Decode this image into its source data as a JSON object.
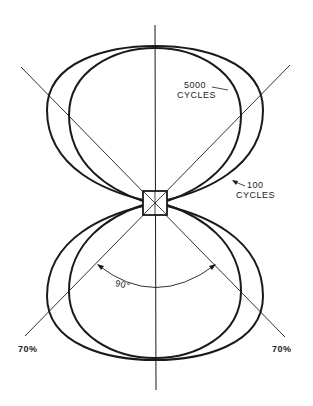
{
  "diagram": {
    "type": "polar-directivity-pattern",
    "labels": {
      "high_freq_line1": "5000",
      "high_freq_line2": "CYCLES",
      "low_freq_line1": "100",
      "low_freq_line2": "CYCLES",
      "angle": "90°",
      "left_percent": "70%",
      "right_percent": "70%"
    },
    "colors": {
      "ink": "#1a1a1a",
      "background": "#ffffff"
    }
  }
}
